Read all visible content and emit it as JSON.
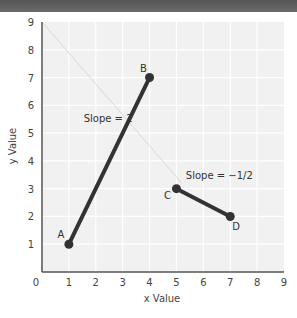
{
  "header": {
    "color": "#5e5e5e"
  },
  "chart_data": {
    "type": "line",
    "title": "",
    "xlabel": "x Value",
    "ylabel": "y Value",
    "xlim": [
      0,
      9
    ],
    "ylim": [
      0,
      9
    ],
    "x_ticks": [
      "0",
      "1",
      "2",
      "3",
      "4",
      "5",
      "6",
      "7",
      "8",
      "9"
    ],
    "y_ticks": [
      "1",
      "2",
      "3",
      "4",
      "5",
      "6",
      "7",
      "8",
      "9"
    ],
    "grid": true,
    "legend": null,
    "series": [
      {
        "name": "AB",
        "points": [
          {
            "label": "A",
            "x": 1,
            "y": 1
          },
          {
            "label": "B",
            "x": 4,
            "y": 7
          }
        ],
        "color": "#333333"
      },
      {
        "name": "CD",
        "points": [
          {
            "label": "C",
            "x": 5,
            "y": 3
          },
          {
            "label": "D",
            "x": 7,
            "y": 2
          }
        ],
        "color": "#333333"
      }
    ],
    "annotations": [
      {
        "text": "Slope = 2",
        "x": 1.55,
        "y": 5.4
      },
      {
        "text": "Slope = −1/2",
        "x": 5.35,
        "y": 3.35
      }
    ],
    "background_line": {
      "from": [
        0,
        9
      ],
      "to": [
        5.2,
        3.2
      ],
      "color": "#d8d8d8"
    },
    "colors": {
      "plot_bg": "#f1f1f1",
      "grid": "#ffffff",
      "axis": "#555555",
      "line": "#333333"
    }
  }
}
